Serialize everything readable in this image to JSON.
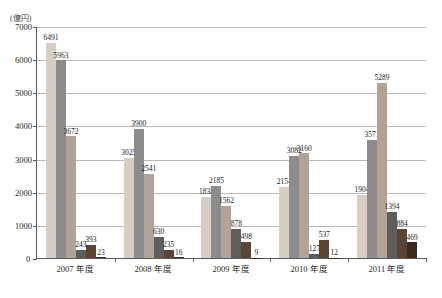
{
  "chart_data": {
    "type": "bar",
    "title": "",
    "xlabel": "",
    "ylabel": "(億円)",
    "ylim": [
      0,
      7000
    ],
    "yticks": [
      0,
      1000,
      2000,
      3000,
      4000,
      5000,
      6000,
      7000
    ],
    "ytick_labels": [
      "0",
      "1000",
      "2000",
      "3000",
      "4000",
      "5000",
      "6000",
      "7000"
    ],
    "grid": true,
    "legend": "none",
    "categories": [
      "2007 年度",
      "2008 年度",
      "2009 年度",
      "2010 年度",
      "2011 年度"
    ],
    "series": [
      {
        "name": "series-1",
        "color": "#d8cdc2",
        "values": [
          6491,
          3025,
          1838,
          2154,
          1904
        ]
      },
      {
        "name": "series-2",
        "color": "#8c8c8c",
        "values": [
          5963,
          3900,
          2185,
          3082,
          3571
        ]
      },
      {
        "name": "series-3",
        "color": "#b3a396",
        "values": [
          3672,
          2541,
          1562,
          3160,
          5289
        ]
      },
      {
        "name": "series-4",
        "color": "#5e5e5e",
        "values": [
          243,
          630,
          878,
          127,
          1394
        ]
      },
      {
        "name": "series-5",
        "color": "#5b4436",
        "values": [
          393,
          235,
          498,
          537,
          884
        ]
      },
      {
        "name": "series-6",
        "color": "#3b2a20",
        "values": [
          23,
          16,
          9,
          12,
          469
        ]
      }
    ]
  }
}
